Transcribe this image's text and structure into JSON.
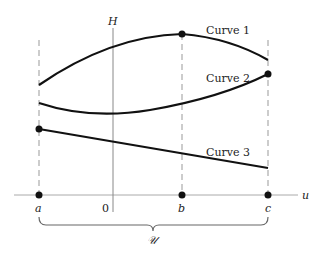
{
  "diagram": {
    "vertical_axis_label": "H",
    "horizontal_axis_label": "u",
    "origin_label": "0",
    "points": [
      {
        "id": "a",
        "label": "a"
      },
      {
        "id": "b",
        "label": "b"
      },
      {
        "id": "c",
        "label": "c"
      }
    ],
    "brace_label": "𝒰",
    "curves": [
      {
        "id": "curve1",
        "label": "Curve 1",
        "marked_point": "b",
        "note": "maximum at b"
      },
      {
        "id": "curve2",
        "label": "Curve 2",
        "marked_point": "c",
        "note": "maximum at c"
      },
      {
        "id": "curve3",
        "label": "Curve 3",
        "marked_point": "a",
        "note": "maximum at a"
      }
    ]
  }
}
